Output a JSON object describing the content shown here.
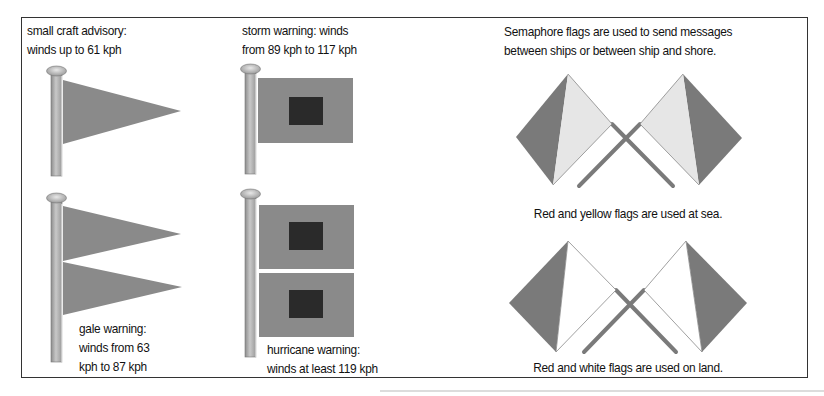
{
  "storm_flags": {
    "small_craft": {
      "line1": "small craft advisory:",
      "line2": "winds up to 61 kph"
    },
    "storm": {
      "line1": "storm warning: winds",
      "line2": "from 89 kph to 117 kph"
    },
    "gale": {
      "line1": "gale warning:",
      "line2": "winds from 63",
      "line3": "kph to 87 kph"
    },
    "hurricane": {
      "line1": "hurricane warning:",
      "line2": "winds at least 119 kph"
    }
  },
  "semaphore": {
    "intro_line1": "Semaphore flags are used to send messages",
    "intro_line2": "between ships or between ship and shore.",
    "sea_caption": "Red and yellow flags are used at sea.",
    "land_caption": "Red and white flags are used on land."
  },
  "colors": {
    "flag_fill": "#8a8a8a",
    "flag_dark_square": "#2a2a2a",
    "semaphore_dark": "#7a7a7a",
    "semaphore_light": "#e6e6e6",
    "semaphore_white": "#ffffff",
    "pole": "#a0a0a0",
    "border": "#333333"
  }
}
